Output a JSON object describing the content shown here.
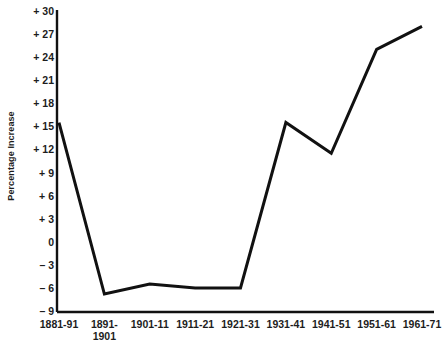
{
  "chart_data": {
    "type": "line",
    "title": "",
    "xlabel": "",
    "ylabel": "Percentage Increase",
    "categories": [
      "1881-91",
      "1891-1901",
      "1901-11",
      "1911-21",
      "1921-31",
      "1931-41",
      "1941-51",
      "1951-61",
      "1961-71"
    ],
    "values": [
      15.5,
      -6.8,
      -5.5,
      -6.0,
      -6.0,
      15.5,
      11.5,
      25.0,
      28.0
    ],
    "ylim": [
      -9,
      30
    ],
    "yticks": [
      30,
      27,
      24,
      21,
      18,
      15,
      12,
      9,
      6,
      3,
      0,
      -3,
      -6,
      -9
    ],
    "ytick_labels": [
      "+ 30",
      "+ 27",
      "+ 24",
      "+ 21",
      "+ 18",
      "+ 15",
      "+ 12",
      "+ 9",
      "+ 6",
      "+ 3",
      "0",
      "– 3",
      "– 6",
      "– 9"
    ],
    "grid": false,
    "legend": false,
    "series": [
      {
        "name": "Percentage Increase",
        "color": "#111111",
        "values": [
          15.5,
          -6.8,
          -5.5,
          -6.0,
          -6.0,
          15.5,
          11.5,
          25.0,
          28.0
        ]
      }
    ],
    "xtick_lines": [
      [
        "1881-91"
      ],
      [
        "1891-",
        "1901"
      ],
      [
        "1901-11"
      ],
      [
        "1911-21"
      ],
      [
        "1921-31"
      ],
      [
        "1931-41"
      ],
      [
        "1941-51"
      ],
      [
        "1951-61"
      ],
      [
        "1961-71"
      ]
    ],
    "axis_color": "#111111",
    "background": "#ffffff"
  }
}
